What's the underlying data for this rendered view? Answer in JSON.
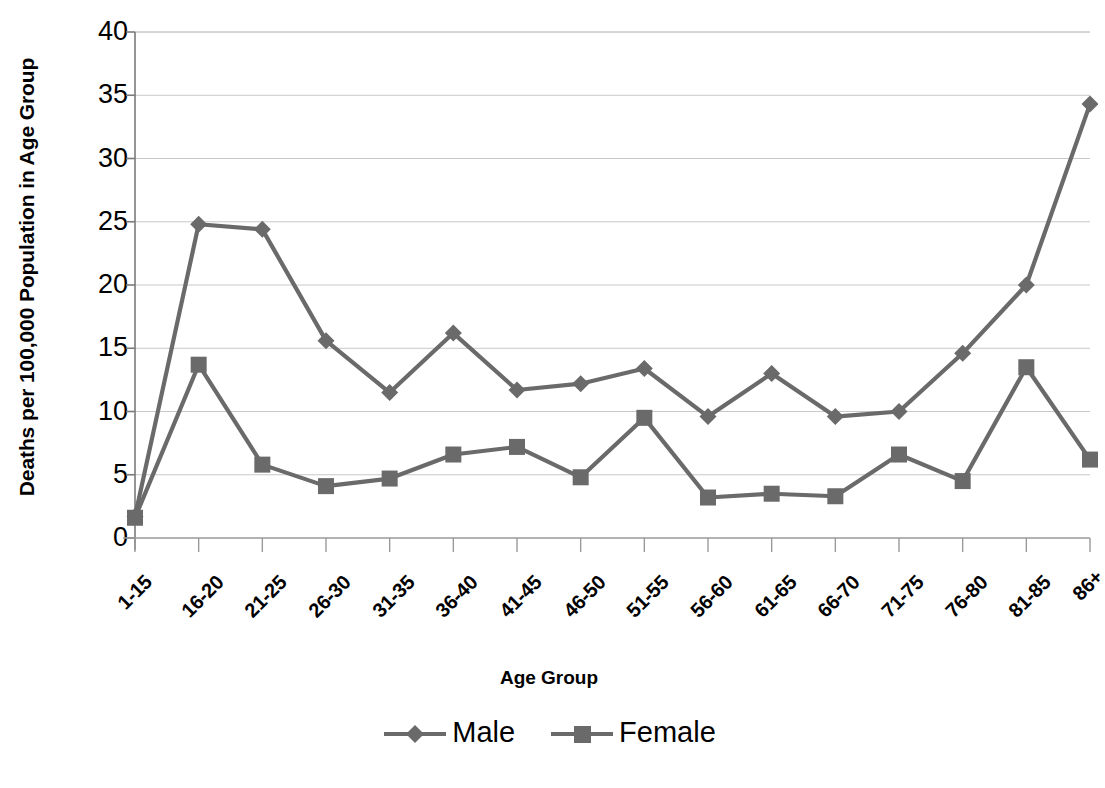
{
  "chart_data": {
    "type": "line",
    "title": "",
    "xlabel": "Age Group",
    "ylabel": "Deaths per 100,000 Population in Age Group",
    "ylim": [
      0,
      40
    ],
    "ytick_labels": [
      "40",
      "35",
      "30",
      "25",
      "20",
      "15",
      "10",
      "5",
      "0"
    ],
    "yticks": [
      40,
      35,
      30,
      25,
      20,
      15,
      10,
      5,
      0
    ],
    "grid": true,
    "legend_position": "bottom",
    "categories": [
      "1-15",
      "16-20",
      "21-25",
      "26-30",
      "31-35",
      "36-40",
      "41-45",
      "46-50",
      "51-55",
      "56-60",
      "61-65",
      "66-70",
      "71-75",
      "76-80",
      "81-85",
      "86+"
    ],
    "series": [
      {
        "name": "Male",
        "marker": "diamond",
        "color": "#6a6a6a",
        "values": [
          1.7,
          24.8,
          24.4,
          15.6,
          11.5,
          16.2,
          11.7,
          12.2,
          13.4,
          9.6,
          13.0,
          9.6,
          10.0,
          14.6,
          20.0,
          34.3
        ]
      },
      {
        "name": "Female",
        "marker": "square",
        "color": "#6a6a6a",
        "values": [
          1.6,
          13.7,
          5.8,
          4.1,
          4.7,
          6.6,
          7.2,
          4.8,
          9.5,
          3.2,
          3.5,
          3.3,
          6.6,
          4.5,
          13.5,
          6.2
        ]
      }
    ]
  },
  "legend": {
    "items": [
      {
        "label": "Male",
        "marker": "diamond"
      },
      {
        "label": "Female",
        "marker": "square"
      }
    ]
  },
  "colors": {
    "series": "#6a6a6a",
    "grid": "#c8c8c8",
    "axis": "#808080",
    "text": "#000000"
  },
  "caption_fragment": ""
}
